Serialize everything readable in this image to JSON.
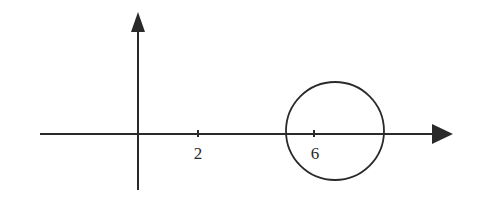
{
  "diagram": {
    "type": "coordinate-plane-with-circle",
    "colors": {
      "stroke": "#2a2a2a",
      "background": "#ffffff"
    },
    "x_axis": {
      "ticks": [
        {
          "value": 2,
          "label": "2"
        },
        {
          "value": 6,
          "label": "6"
        }
      ],
      "arrow": "right"
    },
    "y_axis": {
      "arrow": "up"
    },
    "circle": {
      "center_label": "6",
      "description": "Circle on the x-axis, passing through near the tick at 6"
    }
  }
}
